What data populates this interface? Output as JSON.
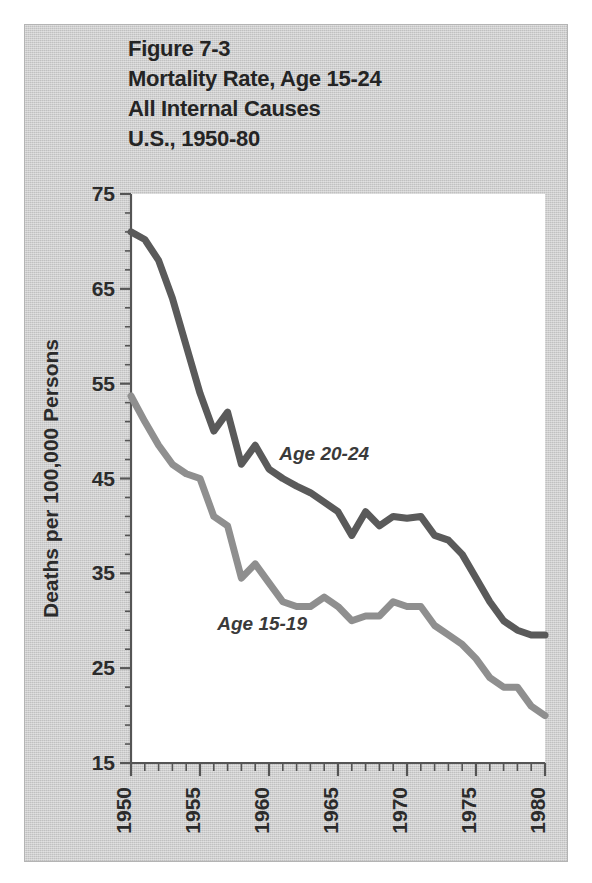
{
  "figure": {
    "title_lines": [
      "Figure 7-3",
      "Mortality Rate, Age 15-24",
      "All Internal Causes",
      "U.S., 1950-80"
    ],
    "panel_color": "#cfcfcf",
    "plot_bg_color": "#ffffff"
  },
  "chart_data": {
    "type": "line",
    "title": "Figure 7-3 Mortality Rate, Age 15-24 All Internal Causes U.S., 1950-80",
    "xlabel": "",
    "ylabel": "Deaths per 100,000 Persons",
    "xlim": [
      1950,
      1980
    ],
    "ylim": [
      15,
      75
    ],
    "grid": false,
    "legend_position": "inline-annotation",
    "y_ticks": [
      15,
      25,
      35,
      45,
      55,
      65,
      75
    ],
    "y_minor_tick_step": 2,
    "x_ticks": [
      1950,
      1955,
      1960,
      1965,
      1970,
      1975,
      1980
    ],
    "x_minor_tick_step": 1,
    "x_tick_label_rotation": -90,
    "x": [
      1950,
      1951,
      1952,
      1953,
      1954,
      1955,
      1956,
      1957,
      1958,
      1959,
      1960,
      1961,
      1962,
      1963,
      1964,
      1965,
      1966,
      1967,
      1968,
      1969,
      1970,
      1971,
      1972,
      1973,
      1974,
      1975,
      1976,
      1977,
      1978,
      1979,
      1980
    ],
    "series": [
      {
        "name": "Age 20-24",
        "color": "#5a5a5a",
        "annotation": "Age 20-24",
        "values": [
          71.0,
          70.2,
          68.0,
          64.0,
          59.0,
          54.0,
          50.0,
          52.0,
          46.5,
          48.5,
          46.0,
          45.0,
          44.2,
          43.5,
          42.5,
          41.5,
          39.0,
          41.5,
          40.0,
          41.0,
          40.8,
          41.0,
          39.0,
          38.5,
          37.0,
          34.5,
          32.0,
          30.0,
          29.0,
          28.5,
          28.5
        ]
      },
      {
        "name": "Age 15-19",
        "color": "#8f8f8f",
        "annotation": "Age 15-19",
        "values": [
          53.7,
          51.0,
          48.5,
          46.5,
          45.5,
          45.0,
          41.0,
          40.0,
          34.5,
          36.0,
          34.0,
          32.0,
          31.5,
          31.5,
          32.5,
          31.5,
          30.0,
          30.5,
          30.5,
          32.0,
          31.5,
          31.5,
          29.5,
          28.5,
          27.5,
          26.0,
          24.0,
          23.0,
          23.0,
          21.0,
          20.0
        ]
      }
    ],
    "annotations": [
      {
        "text": "Age 20-24",
        "x": 1964.0,
        "y": 47.0
      },
      {
        "text": "Age 15-19",
        "x": 1959.5,
        "y": 29.0
      }
    ]
  }
}
